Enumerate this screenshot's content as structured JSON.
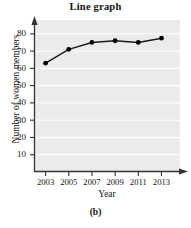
{
  "figure": {
    "caption": "(b)"
  },
  "chart_data": {
    "type": "line",
    "title": "Line graph",
    "xlabel": "Year",
    "ylabel": "Number of women members",
    "categories": [
      "2003",
      "2005",
      "2007",
      "2009",
      "2011",
      "2013"
    ],
    "x": [
      2003,
      2005,
      2007,
      2009,
      2011,
      2013
    ],
    "values": [
      63,
      71,
      75,
      76,
      75,
      77.5
    ],
    "series": [
      {
        "name": "Number of women members",
        "values": [
          63,
          71,
          75,
          76,
          75,
          77.5
        ]
      }
    ],
    "yticks": [
      10,
      20,
      30,
      40,
      50,
      60,
      70,
      80
    ],
    "ytick_labels": [
      "10",
      "20",
      "30",
      "40",
      "50",
      "60",
      "70",
      "80"
    ],
    "xtick_labels": [
      "2003",
      "2005",
      "2007",
      "2009",
      "2011",
      "2013"
    ],
    "ylim": [
      0,
      88
    ],
    "xlim": [
      2002,
      2014.6
    ],
    "grid": "horizontal",
    "legend": "none",
    "marker": "filled-circle",
    "line_color": "#1a1a1a",
    "marker_color": "#000000",
    "plot_background": "#ebebeb",
    "gridline_color": "#ffffff",
    "axis_color": "#3a3a3a"
  }
}
